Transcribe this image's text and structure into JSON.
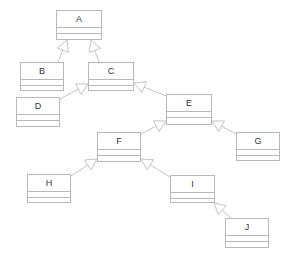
{
  "diagram": {
    "type": "uml-class-diagram",
    "colors": {
      "border": "#b9b9b9",
      "text": "#333333",
      "edge": "#c4c4c4",
      "background": "#ffffff"
    },
    "classes": [
      {
        "id": "A",
        "name": "A",
        "x": 56,
        "y": 10,
        "w": 46,
        "h": 30
      },
      {
        "id": "B",
        "name": "B",
        "x": 20,
        "y": 62,
        "w": 44,
        "h": 29
      },
      {
        "id": "C",
        "name": "C",
        "x": 88,
        "y": 62,
        "w": 46,
        "h": 29
      },
      {
        "id": "D",
        "name": "D",
        "x": 16,
        "y": 97,
        "w": 44,
        "h": 30
      },
      {
        "id": "E",
        "name": "E",
        "x": 166,
        "y": 94,
        "w": 46,
        "h": 31
      },
      {
        "id": "F",
        "name": "F",
        "x": 97,
        "y": 132,
        "w": 44,
        "h": 30
      },
      {
        "id": "G",
        "name": "G",
        "x": 236,
        "y": 132,
        "w": 44,
        "h": 29
      },
      {
        "id": "H",
        "name": "H",
        "x": 27,
        "y": 174,
        "w": 44,
        "h": 29
      },
      {
        "id": "I",
        "name": "I",
        "x": 170,
        "y": 175,
        "w": 45,
        "h": 28
      },
      {
        "id": "J",
        "name": "J",
        "x": 225,
        "y": 218,
        "w": 44,
        "h": 30
      }
    ],
    "generalizations": [
      {
        "child": "B",
        "parent": "A",
        "from": [
          58,
          62
        ],
        "to": [
          67,
          40
        ]
      },
      {
        "child": "C",
        "parent": "A",
        "from": [
          99,
          62
        ],
        "to": [
          91,
          40
        ]
      },
      {
        "child": "D",
        "parent": "C",
        "from": [
          60,
          99
        ],
        "to": [
          88,
          84
        ]
      },
      {
        "child": "E",
        "parent": "C",
        "from": [
          166,
          96
        ],
        "to": [
          134,
          83
        ]
      },
      {
        "child": "F",
        "parent": "E",
        "from": [
          141,
          134
        ],
        "to": [
          166,
          121
        ]
      },
      {
        "child": "G",
        "parent": "E",
        "from": [
          236,
          134
        ],
        "to": [
          212,
          121
        ]
      },
      {
        "child": "H",
        "parent": "F",
        "from": [
          71,
          176
        ],
        "to": [
          97,
          159
        ]
      },
      {
        "child": "I",
        "parent": "F",
        "from": [
          170,
          177
        ],
        "to": [
          141,
          159
        ]
      },
      {
        "child": "J",
        "parent": "I",
        "from": [
          231,
          218
        ],
        "to": [
          214,
          203
        ]
      }
    ]
  }
}
